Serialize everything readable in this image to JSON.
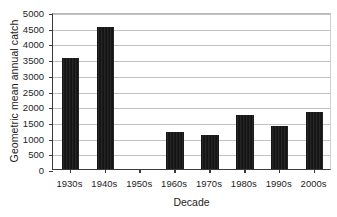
{
  "chart_data": {
    "type": "bar",
    "title": "",
    "xlabel": "Decade",
    "ylabel": "Geometric mean annual catch",
    "categories": [
      "1930s",
      "1940s",
      "1950s",
      "1960s",
      "1970s",
      "1980s",
      "1990s",
      "2000s"
    ],
    "values": [
      3520,
      4510,
      null,
      1170,
      1090,
      1710,
      1380,
      1830
    ],
    "ylim": [
      0,
      5000
    ],
    "ytick_step": 500,
    "yticks": [
      0,
      500,
      1000,
      1500,
      2000,
      2500,
      3000,
      3500,
      4000,
      4500,
      5000
    ],
    "ytick_labels": [
      "0",
      "500",
      "1000",
      "1500",
      "2000",
      "2500",
      "3000",
      "3500",
      "4000",
      "4500",
      "5000"
    ],
    "grid": true,
    "legend": false,
    "bar_color": "#1b1b1b",
    "gridline_color": "#c2c2c2",
    "axis_color": "#3a3a3a"
  }
}
